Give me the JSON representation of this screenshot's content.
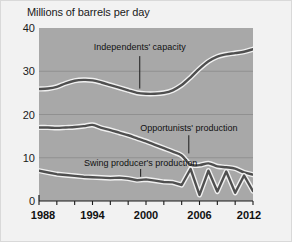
{
  "chart_data": {
    "type": "line",
    "title": "Millions of barrels per day",
    "xlabel": "",
    "ylabel": "Millions of barrels per day",
    "xlim": [
      1988,
      2012
    ],
    "ylim": [
      0,
      40
    ],
    "yticks": [
      0,
      10,
      20,
      30,
      40
    ],
    "xticks": [
      1988,
      1994,
      2000,
      2006,
      2012
    ],
    "xminorticks": [
      1990,
      1992,
      1996,
      1998,
      2002,
      2004,
      2008,
      2010
    ],
    "grid": true,
    "legend_position": "inline-annotations",
    "series": [
      {
        "name": "Independents' capacity",
        "x": [
          1988,
          1989,
          1990,
          1991,
          1992,
          1993,
          1994,
          1995,
          1996,
          1997,
          1998,
          1999,
          2000,
          2001,
          2002,
          2003,
          2004,
          2005,
          2006,
          2007,
          2008,
          2009,
          2010,
          2011,
          2012
        ],
        "values": [
          25.9,
          26.0,
          26.4,
          27.2,
          27.8,
          28.0,
          27.9,
          27.4,
          26.8,
          26.2,
          25.6,
          25.0,
          24.8,
          24.8,
          25.0,
          25.6,
          26.8,
          28.6,
          30.6,
          32.3,
          33.4,
          33.9,
          34.2,
          34.5,
          35.1
        ]
      },
      {
        "name": "Opportunists' production",
        "x": [
          1988,
          1989,
          1990,
          1991,
          1992,
          1993,
          1994,
          1995,
          1996,
          1997,
          1998,
          1999,
          2000,
          2001,
          2002,
          2003,
          2004,
          2005,
          2006,
          2007,
          2008,
          2009,
          2010,
          2011,
          2012
        ],
        "values": [
          17.0,
          17.0,
          16.9,
          17.0,
          17.1,
          17.3,
          17.6,
          16.9,
          16.4,
          15.8,
          15.2,
          14.5,
          13.8,
          13.0,
          12.2,
          11.4,
          10.5,
          8.4,
          8.3,
          8.7,
          8.0,
          7.8,
          7.5,
          6.6,
          6.1
        ]
      },
      {
        "name": "Swing producer's production",
        "x": [
          1988,
          1989,
          1990,
          1991,
          1992,
          1993,
          1994,
          1995,
          1996,
          1997,
          1998,
          1999,
          2000,
          2001,
          2002,
          2003,
          2004,
          2005,
          2006,
          2007,
          2008,
          2009,
          2010,
          2011,
          2012
        ],
        "values": [
          7.0,
          6.6,
          6.2,
          6.0,
          5.8,
          5.6,
          5.5,
          5.4,
          5.3,
          5.4,
          5.2,
          4.8,
          5.0,
          4.7,
          4.4,
          4.3,
          3.7,
          7.4,
          1.4,
          7.0,
          2.2,
          6.8,
          1.9,
          5.9,
          2.3
        ]
      }
    ],
    "annotations": [
      {
        "text": "Independents' capacity",
        "x": 1999.3,
        "y": 35.4,
        "leader_from_y": 33.5,
        "leader_to_y": 26.0
      },
      {
        "text": "Opportunists' production",
        "x": 2004.8,
        "y": 16.6,
        "leader_from_y": 15.2,
        "leader_to_y": 11.0
      },
      {
        "text": "Swing producer's production",
        "x": 1999.4,
        "y": 8.6,
        "leader_from_y": 7.4,
        "leader_to_y": 5.6
      }
    ],
    "colors": {
      "plot_background": "#a8a8a8",
      "page_background": "#f2f2f2",
      "line": "#4f4f4f",
      "line_halo": "#f0f0f0",
      "gridline": "#909090",
      "axis": "#1a1a1a",
      "text": "#1a1a1a"
    }
  }
}
